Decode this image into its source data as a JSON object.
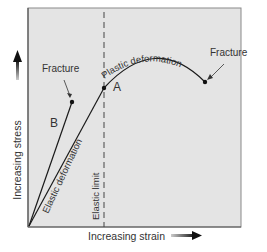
{
  "diagram": {
    "type": "stress-strain",
    "axes": {
      "x_label": "Increasing strain",
      "y_label": "Increasing stress"
    },
    "labels": {
      "fracture_b": "Fracture",
      "fracture_a": "Fracture",
      "curve_b": "B",
      "point_a": "A",
      "elastic_deformation": "Elastic deformation",
      "plastic_deformation": "Plastic deformation",
      "elastic_limit": "Elastic limit"
    },
    "colors": {
      "plot_background": "#e4e4e4",
      "border": "#8a8a8a",
      "line": "#1a1a1a",
      "text": "#333333"
    }
  }
}
